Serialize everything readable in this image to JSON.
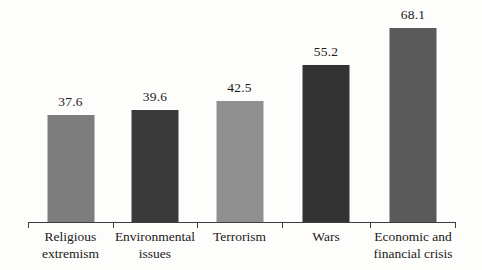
{
  "chart_data": {
    "type": "bar",
    "title": "",
    "subtitle": "",
    "xlabel": "",
    "ylabel": "",
    "ylim": [
      0,
      75
    ],
    "grid": false,
    "legend": "none",
    "orientation": "vertical",
    "categories": [
      "Religious extremism",
      "Environmental issues",
      "Terrorism",
      "Wars",
      "Economic and financial crisis"
    ],
    "category_lines": [
      [
        "Religious",
        "extremism"
      ],
      [
        "Environmental",
        "issues"
      ],
      [
        "Terrorism",
        ""
      ],
      [
        "Wars",
        ""
      ],
      [
        "Economic and",
        "financial crisis"
      ]
    ],
    "values": [
      37.6,
      39.6,
      42.5,
      55.2,
      68.1
    ],
    "value_labels": [
      "37.6",
      "39.6",
      "42.5",
      "55.2",
      "68.1"
    ],
    "bar_colors": [
      "#7d7d7d",
      "#3a3a3a",
      "#8f8f8f",
      "#333333",
      "#5a5a5a"
    ],
    "axis_color": "#3d3d3d",
    "background_color": "#fdfdfb",
    "text_color": "#1a1a1a"
  }
}
